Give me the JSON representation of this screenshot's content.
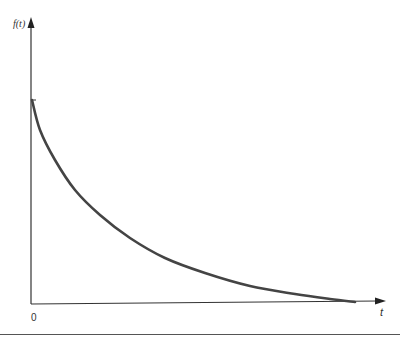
{
  "chart_data": {
    "type": "line",
    "title": "",
    "xlabel": "t",
    "ylabel": "f(t)",
    "origin_label": "0",
    "grid": false,
    "legend": null,
    "series": [
      {
        "name": "f(t)",
        "color": "#444444",
        "points_px": [
          [
            32,
            100
          ],
          [
            40,
            130
          ],
          [
            55,
            160
          ],
          [
            75,
            190
          ],
          [
            100,
            215
          ],
          [
            130,
            238
          ],
          [
            165,
            258
          ],
          [
            205,
            273
          ],
          [
            250,
            286
          ],
          [
            295,
            294
          ],
          [
            330,
            299
          ],
          [
            355,
            302
          ]
        ]
      }
    ],
    "axes": {
      "x_axis": {
        "from_px": [
          31,
          303
        ],
        "to_px": [
          386,
          301
        ],
        "arrow": true
      },
      "y_axis": {
        "from_px": [
          31,
          303
        ],
        "to_px": [
          31,
          18
        ],
        "arrow": true
      },
      "y_tick_px": [
        31,
        100
      ]
    }
  },
  "labels": {
    "y_axis": "f(t)",
    "x_axis": "t",
    "origin": "0"
  }
}
